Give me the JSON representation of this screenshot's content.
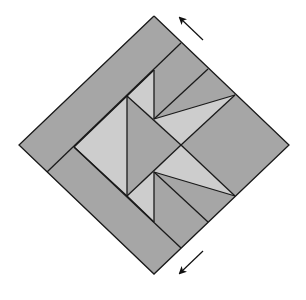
{
  "diagram": {
    "type": "quilt-block",
    "background": "#ffffff",
    "colors": {
      "dark": "#a6a6a6",
      "light": "#cdcdcd",
      "stroke": "#1a1a1a"
    },
    "pieces": [
      {
        "id": "outer-border-upper-left",
        "tone": "dark",
        "points": "154,16 181,43 47,172 19,145"
      },
      {
        "id": "outer-border-lower-left",
        "tone": "dark",
        "points": "47,172 74,147 181,248 154,274"
      },
      {
        "id": "right-large-square",
        "tone": "dark",
        "points": "181,145 235,95 289,145 235,196"
      },
      {
        "id": "top-strip-upper",
        "tone": "dark",
        "points": "181,43 208,69 154,119 154,70"
      },
      {
        "id": "top-strip-lower",
        "tone": "dark",
        "points": "208,69 235,95 154,119"
      },
      {
        "id": "top-light-triangle",
        "tone": "light",
        "points": "154,119 235,95 181,145"
      },
      {
        "id": "top-left-light-sliver",
        "tone": "light",
        "points": "127,96 154,70 154,119"
      },
      {
        "id": "top-inner-strip",
        "tone": "dark",
        "points": "181,43 154,70 127,96 74,147 47,172 19,145 154,16"
      },
      {
        "id": "center-left-light",
        "tone": "light",
        "points": "74,147 127,96 127,196"
      },
      {
        "id": "center-dark-diamond",
        "tone": "dark",
        "points": "127,96 154,119 181,145 154,172 127,196"
      },
      {
        "id": "bottom-light-triangle",
        "tone": "light",
        "points": "154,172 181,145 235,196"
      },
      {
        "id": "bottom-strip-upper",
        "tone": "dark",
        "points": "154,172 235,196 208,222"
      },
      {
        "id": "bottom-strip-lower",
        "tone": "dark",
        "points": "154,172 208,222 181,248 154,222"
      },
      {
        "id": "bottom-left-light-sliver",
        "tone": "light",
        "points": "127,196 154,172 154,222"
      },
      {
        "id": "bottom-inner-strip",
        "tone": "dark",
        "points": "74,147 127,196 154,222 181,248 154,274 47,172"
      }
    ],
    "lines": [
      {
        "id": "outline",
        "points": "154,16 289,145 154,274 19,145 154,16"
      },
      {
        "id": "border-seam-top",
        "points": "181,43 47,172"
      },
      {
        "id": "border-seam-bottom",
        "points": "74,147 181,248"
      },
      {
        "id": "inner-diamond-top",
        "points": "74,147 127,96 154,70"
      },
      {
        "id": "inner-diamond-edge-ur",
        "points": "127,96 181,145"
      },
      {
        "id": "inner-diamond-edge-lr",
        "points": "127,196 181,145"
      },
      {
        "id": "inner-diamond-bottom",
        "points": "74,147 127,196 154,222"
      },
      {
        "id": "vertical-left",
        "points": "127,96 127,196"
      },
      {
        "id": "vertical-top",
        "points": "154,70 154,119"
      },
      {
        "id": "vertical-bottom",
        "points": "154,172 154,222"
      },
      {
        "id": "top-fan-1",
        "points": "154,119 208,69"
      },
      {
        "id": "top-fan-2",
        "points": "154,119 235,95"
      },
      {
        "id": "bottom-fan-1",
        "points": "154,172 235,196"
      },
      {
        "id": "bottom-fan-2",
        "points": "154,172 208,222"
      },
      {
        "id": "right-square-top",
        "points": "181,145 235,95"
      },
      {
        "id": "right-square-bottom",
        "points": "181,145 235,196"
      }
    ],
    "arrows": [
      {
        "id": "arrow-top",
        "direction": "up-left",
        "x1": 203,
        "y1": 40,
        "x2": 180,
        "y2": 18
      },
      {
        "id": "arrow-bottom",
        "direction": "down-left",
        "x1": 203,
        "y1": 251,
        "x2": 180,
        "y2": 273
      }
    ]
  }
}
